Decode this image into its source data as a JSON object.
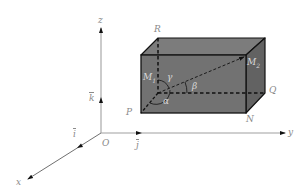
{
  "diagram": {
    "type": "3d-coordinate-system-with-rectangular-box",
    "axes": {
      "x": {
        "label": "x"
      },
      "y": {
        "label": "y"
      },
      "z": {
        "label": "z"
      },
      "origin": {
        "label": "O"
      }
    },
    "unit_vectors": {
      "i": {
        "label": "i"
      },
      "j": {
        "label": "j"
      },
      "k": {
        "label": "k"
      }
    },
    "points": {
      "R": "R",
      "P": "P",
      "Q": "Q",
      "N": "N",
      "M1": "M",
      "M1_sub": "1",
      "M2": "M",
      "M2_sub": "2"
    },
    "angles": {
      "alpha": "α",
      "beta": "β",
      "gamma": "γ"
    },
    "colors": {
      "box_fill": "#6e6e6e",
      "box_top": "#7a7a7a",
      "box_side": "#5e5e5e",
      "edge": "#111111",
      "axis": "#9a9a9a",
      "label": "#8a8a8a"
    }
  }
}
